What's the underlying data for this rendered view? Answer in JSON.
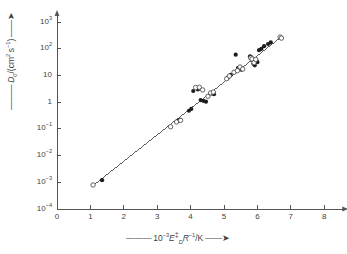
{
  "chart_data": {
    "type": "scatter",
    "title": "",
    "xlabel": "10^-3 E_D^‡ R^-1 / K",
    "ylabel": "D_0 / (cm^2 s^-1)",
    "xlabel_parts": {
      "prefix": "10",
      "prefix_exp": "-3",
      "var": "E",
      "var_sub": "D",
      "var_sup": "‡",
      "var2": "R",
      "var2_exp": "-1",
      "unit": "/K"
    },
    "ylabel_parts": {
      "var": "D",
      "var_sub": "0",
      "unit_open": "/(cm",
      "unit_exp1": "2",
      "unit_mid": " s",
      "unit_exp2": "-1",
      "unit_close": ")"
    },
    "xscale": "linear",
    "yscale": "log",
    "xlim": [
      0,
      8.6
    ],
    "ylim_exp": [
      -4,
      3.3
    ],
    "grid": false,
    "legend": "none",
    "xticks": [
      0,
      1,
      2,
      3,
      4,
      5,
      6,
      7,
      8
    ],
    "xtick_labels": [
      "0",
      "1",
      "2",
      "3",
      "4",
      "5",
      "6",
      "7",
      "8"
    ],
    "ytick_exponents": [
      3,
      2,
      1,
      0,
      -1,
      -2,
      -3,
      -4
    ],
    "ytick_labels": [
      "10^3",
      "10^2",
      "10",
      "1",
      "10^-1",
      "10^-2",
      "10^-3",
      "10^-4"
    ],
    "fit_line": {
      "x_start": 1.05,
      "y_start_exp": -3.15,
      "x_end": 6.75,
      "y_end_exp": 2.48,
      "style": "solid",
      "color": "#4a4a4a"
    },
    "series": [
      {
        "name": "filled-circles",
        "marker": "filled-circle",
        "color": "#1c1c1c",
        "points": [
          [
            1.35,
            -2.92
          ],
          [
            3.62,
            -0.7
          ],
          [
            3.67,
            -0.66
          ],
          [
            3.95,
            -0.32
          ],
          [
            4.02,
            -0.25
          ],
          [
            4.08,
            0.42
          ],
          [
            4.22,
            0.48
          ],
          [
            4.3,
            0.08
          ],
          [
            4.38,
            0.05
          ],
          [
            4.46,
            0.02
          ],
          [
            4.63,
            0.33
          ],
          [
            4.7,
            0.3
          ],
          [
            5.12,
            0.92
          ],
          [
            5.2,
            1.02
          ],
          [
            5.35,
            1.78
          ],
          [
            5.42,
            1.28
          ],
          [
            5.52,
            1.22
          ],
          [
            5.78,
            1.72
          ],
          [
            5.82,
            1.68
          ],
          [
            5.86,
            1.58
          ],
          [
            5.88,
            1.44
          ],
          [
            5.92,
            1.38
          ],
          [
            5.97,
            1.55
          ],
          [
            6.0,
            1.5
          ],
          [
            6.05,
            1.95
          ],
          [
            6.12,
            2.0
          ],
          [
            6.2,
            2.1
          ],
          [
            6.32,
            2.18
          ],
          [
            6.4,
            2.24
          ]
        ]
      },
      {
        "name": "open-circles",
        "marker": "open-circle",
        "color": "#4a4a4a",
        "points": [
          [
            1.08,
            -3.1
          ],
          [
            3.4,
            -0.92
          ],
          [
            3.58,
            -0.74
          ],
          [
            3.7,
            -0.68
          ],
          [
            4.15,
            0.55
          ],
          [
            4.26,
            0.56
          ],
          [
            4.36,
            0.46
          ],
          [
            4.52,
            0.22
          ],
          [
            4.6,
            0.35
          ],
          [
            4.68,
            0.38
          ],
          [
            5.08,
            0.88
          ],
          [
            5.16,
            0.98
          ],
          [
            5.3,
            1.12
          ],
          [
            5.4,
            1.18
          ],
          [
            5.48,
            1.32
          ],
          [
            5.56,
            1.24
          ],
          [
            5.8,
            1.66
          ],
          [
            5.84,
            1.62
          ],
          [
            5.9,
            1.48
          ],
          [
            5.95,
            1.6
          ],
          [
            6.68,
            2.44
          ],
          [
            6.72,
            2.4
          ]
        ]
      }
    ]
  }
}
